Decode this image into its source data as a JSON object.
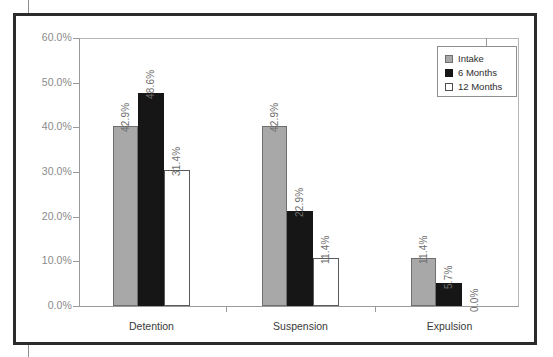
{
  "chart_data": {
    "type": "bar",
    "title": "",
    "xlabel": "",
    "ylabel": "",
    "ylim": [
      0,
      60
    ],
    "ytick_labels": [
      "0.0%",
      "10.0%",
      "20.0%",
      "30.0%",
      "40.0%",
      "50.0%",
      "60.0%"
    ],
    "ytick_values": [
      0,
      10,
      20,
      30,
      40,
      50,
      60
    ],
    "grid": false,
    "legend_position": "top-right",
    "categories": [
      "Detention",
      "Suspension",
      "Expulsion"
    ],
    "series": [
      {
        "name": "Intake",
        "color": "#a8a8a8",
        "values": [
          42.9,
          42.9,
          11.4
        ],
        "labels": [
          "42.9%",
          "42.9%",
          "11.4%"
        ],
        "plotted": [
          40.3,
          40.3,
          10.8
        ]
      },
      {
        "name": "6 Months",
        "color": "#161616",
        "values": [
          48.6,
          22.9,
          5.7
        ],
        "labels": [
          "48.6%",
          "22.9%",
          "5.7%"
        ],
        "plotted": [
          47.7,
          21.3,
          5.1
        ]
      },
      {
        "name": "12 Months",
        "color": "#ffffff",
        "values": [
          31.4,
          11.4,
          0.0
        ],
        "labels": [
          "31.4%",
          "11.4%",
          "0.0%"
        ],
        "plotted": [
          30.4,
          10.8,
          0.0
        ]
      }
    ]
  },
  "legend": {
    "items": [
      {
        "label": "Intake",
        "swatch": "intake"
      },
      {
        "label": "6 Months",
        "swatch": "m6"
      },
      {
        "label": "12 Months",
        "swatch": "m12"
      }
    ]
  }
}
